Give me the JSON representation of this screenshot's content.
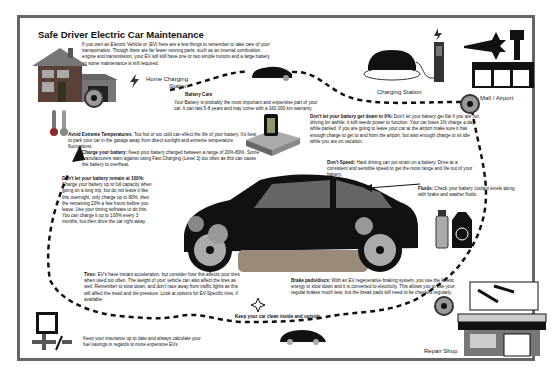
{
  "title": "Safe Driver Electric Car Maintenance",
  "intro": "If you own an Electric Vehicle or (EV) here are a few things to remember to take care of your transportation. Though there are far fewer moving parts, such as an internal combustion engine and transmission, your EV will still have one or two simple motors and a large battery, so some maintenance is still required.",
  "locations": {
    "home": "Home Charging Station",
    "charging_station": "Charging Station",
    "mall_airport": "Mall / Airport",
    "repair_shop": "Repair Shop"
  },
  "tips": {
    "battery_care": {
      "heading": "Battery Care",
      "body": "Your Battery is probably the most important and expensive part of your car. It can last 5-8 years and may come with a 160,000 km warranty."
    },
    "temperatures": {
      "heading": "Avoid Extreme Temperatures:",
      "body": "Too hot or too cold can effect the life of your battery. It's best to park your car in the garage away from direct sunlight and extreme temperature fluctuations."
    },
    "charge": {
      "heading": "Charge your battery:",
      "body": "Keep your battery charged between a range of 20%-80%. Some manufacturers warn against using Fast Charging (Level 3) too often as this can cause the battery to overheat."
    },
    "not_100": {
      "heading": "Don't let your battery remain at 100%:",
      "body": "Charge your battery up to full capacity when going on a long trip, but do not leave it like this overnight, only charge up to 80%, then the remaining 20% a few hours before you leave. Use your timing software to do this. You can charge it up to 100% every 3 months, but then drive the car right away."
    },
    "not_0": {
      "heading": "Don't let your battery get down to 0%:",
      "body": "Don't let your battery get flat if you are not driving for awhile; it still needs power to function. Your car loses 1% charge a day while parked. If you are going to leave your car at the airport make sure it has enough charge to get to and from the airport, but also enough charge to sit idle while you are on vacation."
    },
    "speed": {
      "heading": "Don't Speed:",
      "body": "Hard driving can put strain on a battery. Drive at a consistent and sensible speed to get the most range and life out of your battery."
    },
    "fluids": {
      "heading": "Fluids:",
      "body": "Check your battery coolant levels along with brake and washer fluids."
    },
    "tires": {
      "heading": "Tires:",
      "body": "EV's have instant acceleration, but consider how this affects your tires when used too often. The weight of your vehicle can also affect the tires as well. Remember to slow down, and don't race away from traffic lights as this will affect the tread and tire pressure. Look at options for EV-Specific tires, if available."
    },
    "brakes": {
      "heading": "Brake pads/discs:",
      "body": "With an EV regenerative braking system, you use the kinetic energy to slow down and it is converted to electricity. This allows you to use your regular brakes much less, but the break pads still need to be checked regularly."
    },
    "clean": {
      "heading": "Keep your car clean inside and outside."
    },
    "insurance": {
      "body": "Keep your insurance up to date and always calculate your fuel savings in regards to more expensive EVs."
    }
  },
  "colors": {
    "border": "#666666",
    "ink": "#111111",
    "battery_green": "#8a9a6a",
    "wheel_grey": "#888888"
  }
}
